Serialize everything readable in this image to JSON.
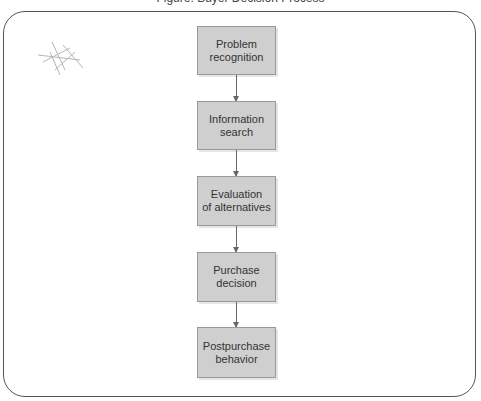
{
  "title": "Figure: Buyer Decision Process",
  "diagram": {
    "type": "flowchart",
    "direction": "top-to-bottom",
    "steps": [
      {
        "line1": "Problem",
        "line2": "recognition"
      },
      {
        "line1": "Information",
        "line2": "search"
      },
      {
        "line1": "Evaluation",
        "line2": "of alternatives"
      },
      {
        "line1": "Purchase",
        "line2": "decision"
      },
      {
        "line1": "Postpurchase",
        "line2": "behavior"
      }
    ],
    "colors": {
      "box_fill": "#cfcfcf",
      "box_border": "#999999",
      "arrow": "#666666",
      "frame": "#555555"
    }
  }
}
